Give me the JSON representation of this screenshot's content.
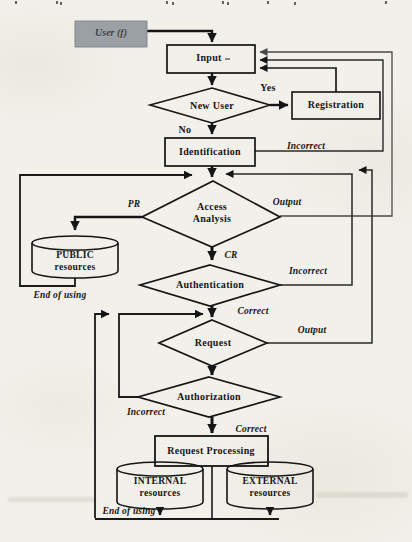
{
  "colors": {
    "paper": "#f2f0ea",
    "ink": "#1a1a1a",
    "user_box_fill": "#9aa0a3",
    "gray_line": "#4a4a4a"
  },
  "nodes": {
    "user": {
      "label": "User (f)"
    },
    "input": {
      "label": "Input"
    },
    "new_user": {
      "label": "New User"
    },
    "registration": {
      "label": "Registration"
    },
    "identification": {
      "label": "Identification"
    },
    "access_analysis": {
      "line1": "Access",
      "line2": "Analysis"
    },
    "public_resources": {
      "line1": "PUBLIC",
      "line2": "resources"
    },
    "authentication": {
      "label": "Authentication"
    },
    "request": {
      "label": "Request"
    },
    "authorization": {
      "label": "Authorization"
    },
    "request_processing": {
      "label": "Request Processing"
    },
    "internal_resources": {
      "line1": "INTERNAL",
      "line2": "resources"
    },
    "external_resources": {
      "line1": "EXTERNAL",
      "line2": "resources"
    }
  },
  "edge_labels": {
    "yes": "Yes",
    "no": "No",
    "identification_incorrect": "Incorrect",
    "pr": "PR",
    "cr": "CR",
    "access_output": "Output",
    "authentication_incorrect": "Incorrect",
    "authentication_correct": "Correct",
    "request_output": "Output",
    "authorization_incorrect": "Incorrect",
    "authorization_correct": "Correct",
    "public_end_of_using": "End of using",
    "bottom_end_of_using": "End of using"
  }
}
